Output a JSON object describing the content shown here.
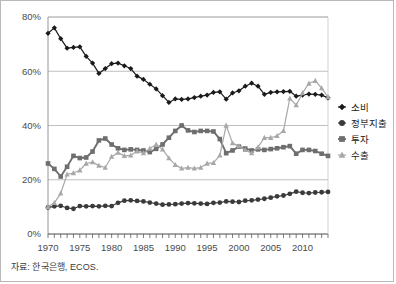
{
  "figure": {
    "source_note": "자료: 한국은행, ECOS.",
    "border_color": "#b9b9b9",
    "background": "#ffffff"
  },
  "chart_data": {
    "type": "line",
    "title": "",
    "xlabel": "",
    "ylabel": "",
    "xlim": [
      1970,
      2014
    ],
    "ylim": [
      0,
      80
    ],
    "yticks": [
      0,
      20,
      40,
      60,
      80
    ],
    "ytick_labels": [
      "0%",
      "20%",
      "40%",
      "60%",
      "80%"
    ],
    "xticks": [
      1970,
      1975,
      1980,
      1985,
      1990,
      1995,
      2000,
      2005,
      2010
    ],
    "xtick_labels": [
      "1970",
      "1975",
      "1980",
      "1985",
      "1990",
      "1995",
      "2000",
      "2005",
      "2010"
    ],
    "grid": "horizontal",
    "legend_position": "right",
    "x": [
      1970,
      1971,
      1972,
      1973,
      1974,
      1975,
      1976,
      1977,
      1978,
      1979,
      1980,
      1981,
      1982,
      1983,
      1984,
      1985,
      1986,
      1987,
      1988,
      1989,
      1990,
      1991,
      1992,
      1993,
      1994,
      1995,
      1996,
      1997,
      1998,
      1999,
      2000,
      2001,
      2002,
      2003,
      2004,
      2005,
      2006,
      2007,
      2008,
      2009,
      2010,
      2011,
      2012,
      2013,
      2014
    ],
    "series": [
      {
        "name": "소비",
        "marker": "diamond",
        "color": "#1a1a1a",
        "values": [
          74.0,
          76.0,
          72.0,
          68.5,
          68.8,
          69.0,
          65.5,
          63.0,
          59.2,
          61.0,
          62.8,
          63.0,
          62.0,
          61.0,
          58.2,
          57.0,
          55.2,
          53.5,
          51.0,
          48.5,
          49.8,
          49.6,
          49.8,
          50.3,
          50.8,
          51.2,
          52.2,
          52.4,
          49.7,
          52.0,
          52.8,
          54.5,
          55.6,
          54.5,
          51.5,
          52.2,
          52.4,
          52.5,
          52.6,
          50.8,
          51.2,
          51.6,
          51.5,
          51.2,
          50.2
        ]
      },
      {
        "name": "정부지출",
        "marker": "circle",
        "color": "#3a3a3a",
        "values": [
          9.8,
          10.2,
          10.4,
          9.6,
          9.3,
          10.3,
          10.2,
          10.3,
          10.2,
          10.4,
          10.3,
          11.5,
          12.3,
          12.4,
          12.2,
          12.0,
          11.6,
          11.2,
          10.8,
          10.9,
          11.0,
          11.2,
          11.4,
          11.3,
          11.2,
          11.1,
          11.5,
          11.6,
          12.0,
          11.9,
          11.8,
          12.3,
          12.4,
          12.7,
          13.0,
          13.4,
          13.9,
          14.2,
          14.8,
          15.6,
          15.2,
          15.1,
          15.3,
          15.4,
          15.5
        ]
      },
      {
        "name": "투자",
        "marker": "square",
        "color": "#6e6e6e",
        "values": [
          26.0,
          24.0,
          21.2,
          24.8,
          28.8,
          28.0,
          28.2,
          30.4,
          34.5,
          35.2,
          33.0,
          31.6,
          31.0,
          31.2,
          31.0,
          30.8,
          30.2,
          31.4,
          33.0,
          35.5,
          38.0,
          40.0,
          38.2,
          37.6,
          38.0,
          38.0,
          37.8,
          35.0,
          29.8,
          30.8,
          32.2,
          31.5,
          30.8,
          31.2,
          31.0,
          31.3,
          31.6,
          32.0,
          32.4,
          29.6,
          31.0,
          31.0,
          30.6,
          29.6,
          28.8
        ]
      },
      {
        "name": "수출",
        "marker": "triangle",
        "color": "#a8a8a8",
        "values": [
          10.0,
          11.5,
          15.0,
          22.0,
          22.5,
          23.5,
          26.0,
          26.5,
          25.2,
          24.5,
          28.5,
          30.0,
          28.8,
          29.0,
          30.5,
          29.8,
          31.5,
          33.0,
          31.2,
          28.0,
          25.5,
          24.2,
          24.5,
          24.2,
          24.5,
          26.0,
          26.2,
          29.0,
          40.0,
          33.5,
          32.4,
          31.0,
          29.8,
          32.0,
          35.5,
          35.5,
          36.2,
          38.0,
          50.0,
          47.5,
          52.0,
          55.5,
          56.5,
          53.8,
          50.5
        ]
      }
    ]
  },
  "legend": {
    "items": [
      {
        "label": "소비",
        "marker": "diamond",
        "color": "#1a1a1a"
      },
      {
        "label": "정부지출",
        "marker": "circle",
        "color": "#3a3a3a"
      },
      {
        "label": "투자",
        "marker": "square",
        "color": "#6e6e6e"
      },
      {
        "label": "수출",
        "marker": "triangle",
        "color": "#a8a8a8"
      }
    ]
  }
}
